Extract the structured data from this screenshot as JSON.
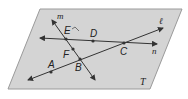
{
  "diagram": {
    "plane": {
      "label": "T",
      "fill": "#d4d4d4",
      "stroke": "#9a9a9a",
      "vertices": [
        [
          40,
          9
        ],
        [
          182,
          9
        ],
        [
          150,
          89
        ],
        [
          8,
          89
        ]
      ]
    },
    "lines": [
      {
        "name": "m",
        "from": [
          52,
          20
        ],
        "to": [
          95,
          80
        ]
      },
      {
        "name": "n",
        "from": [
          40,
          38
        ],
        "to": [
          157,
          44
        ]
      },
      {
        "name": "ℓ",
        "from": [
          28,
          80
        ],
        "to": [
          163,
          28
        ]
      }
    ],
    "points": [
      {
        "label": "E",
        "at": [
          66,
          39
        ]
      },
      {
        "label": "D",
        "at": [
          93,
          41
        ]
      },
      {
        "label": "C",
        "at": [
          124,
          43
        ]
      },
      {
        "label": "F",
        "at": [
          73,
          49
        ]
      },
      {
        "label": "B",
        "at": [
          80,
          59
        ]
      },
      {
        "label": "A",
        "at": [
          51,
          72
        ]
      }
    ],
    "labels": {
      "m": "m",
      "n": "n",
      "l": "ℓ",
      "E": "E",
      "D": "D",
      "C": "C",
      "F": "F",
      "B": "B",
      "A": "A",
      "T": "T"
    },
    "colors": {
      "line": "#333333",
      "point": "#333333"
    }
  }
}
